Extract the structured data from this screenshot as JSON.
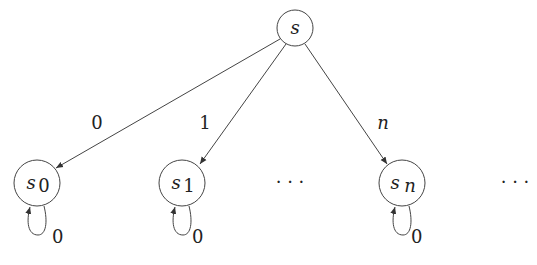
{
  "diagram": {
    "root": {
      "label": "s"
    },
    "nodes": [
      {
        "label": "s",
        "sub": "0"
      },
      {
        "label": "s",
        "sub": "1"
      },
      {
        "label": "s",
        "sub": "n"
      }
    ],
    "edges": [
      {
        "from": "s",
        "to": "s_0",
        "label": "0"
      },
      {
        "from": "s",
        "to": "s_1",
        "label": "1"
      },
      {
        "from": "s",
        "to": "s_n",
        "label": "n"
      }
    ],
    "self_loops": [
      {
        "node": "s_0",
        "label": "0"
      },
      {
        "node": "s_1",
        "label": "0"
      },
      {
        "node": "s_n",
        "label": "0"
      }
    ],
    "ellipsis": [
      "· · ·",
      "· · ·"
    ]
  }
}
